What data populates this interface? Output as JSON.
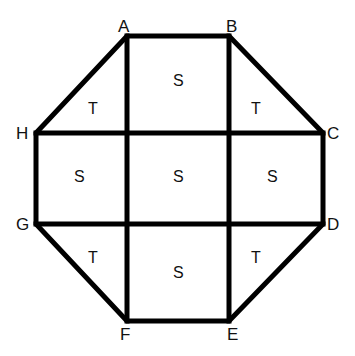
{
  "diagram": {
    "type": "octagon-grid",
    "stroke_color": "#000000",
    "background": "#ffffff",
    "vertices": [
      {
        "id": "A",
        "label": "A",
        "x": 127,
        "y": 36
      },
      {
        "id": "B",
        "label": "B",
        "x": 229,
        "y": 36
      },
      {
        "id": "C",
        "label": "C",
        "x": 323,
        "y": 133
      },
      {
        "id": "D",
        "label": "D",
        "x": 323,
        "y": 224
      },
      {
        "id": "E",
        "label": "E",
        "x": 229,
        "y": 321
      },
      {
        "id": "F",
        "label": "F",
        "x": 127,
        "y": 321
      },
      {
        "id": "G",
        "label": "G",
        "x": 36,
        "y": 224
      },
      {
        "id": "H",
        "label": "H",
        "x": 36,
        "y": 133
      }
    ],
    "regions": [
      {
        "label": "S",
        "position": "top-center"
      },
      {
        "label": "T",
        "position": "top-left"
      },
      {
        "label": "T",
        "position": "top-right"
      },
      {
        "label": "S",
        "position": "middle-left"
      },
      {
        "label": "S",
        "position": "center"
      },
      {
        "label": "S",
        "position": "middle-right"
      },
      {
        "label": "T",
        "position": "bottom-left"
      },
      {
        "label": "S",
        "position": "bottom-center"
      },
      {
        "label": "T",
        "position": "bottom-right"
      }
    ]
  }
}
